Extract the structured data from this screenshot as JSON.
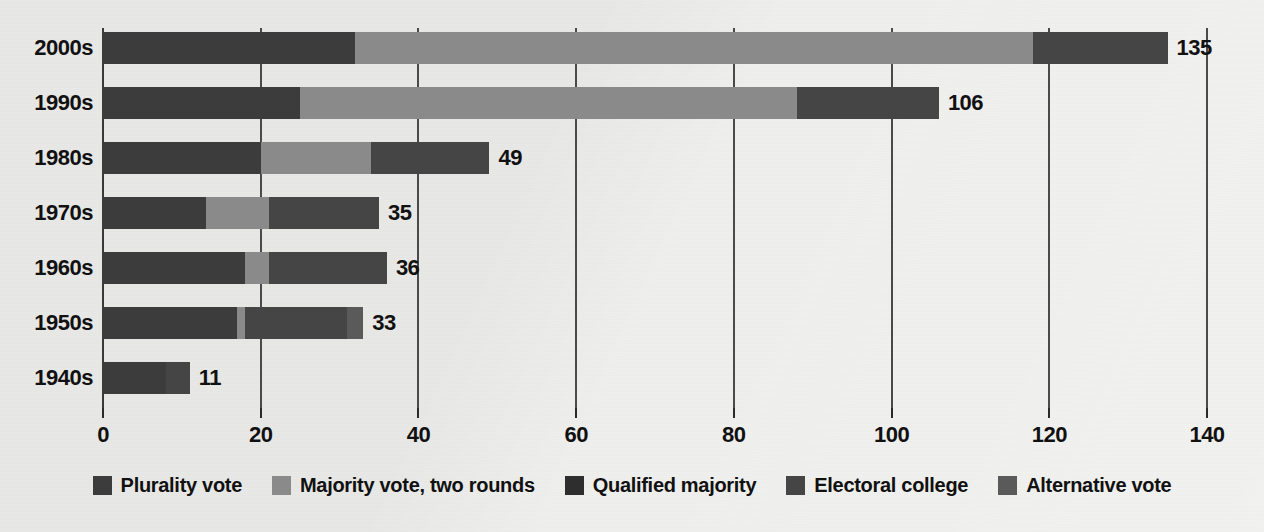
{
  "chart_data": {
    "type": "bar",
    "orientation": "horizontal",
    "stacked": true,
    "title": "",
    "subtitle": "",
    "xlabel": "",
    "ylabel": "",
    "xlim": [
      0,
      140
    ],
    "xticks": [
      0,
      20,
      40,
      60,
      80,
      100,
      120,
      140
    ],
    "xticklabels": [
      "0",
      "20",
      "40",
      "60",
      "80",
      "100",
      "120",
      "140"
    ],
    "grid": "vertical",
    "legend_position": "bottom",
    "categories": [
      "2000s",
      "1990s",
      "1980s",
      "1970s",
      "1960s",
      "1950s",
      "1940s"
    ],
    "series": [
      {
        "name": "Plurality vote",
        "color": "#3c3c3c",
        "values": [
          32,
          25,
          20,
          13,
          18,
          17,
          8
        ]
      },
      {
        "name": "Majority vote, two rounds",
        "color": "#8a8a8a",
        "values": [
          86,
          63,
          14,
          8,
          3,
          1,
          0
        ]
      },
      {
        "name": "Qualified majority",
        "color": "#2e2e2e",
        "values": [
          0,
          0,
          0,
          0,
          0,
          0,
          0
        ]
      },
      {
        "name": "Electoral college",
        "color": "#454545",
        "values": [
          17,
          18,
          15,
          14,
          15,
          13,
          3
        ]
      },
      {
        "name": "Alternative vote",
        "color": "#5a5a5a",
        "values": [
          0,
          0,
          0,
          0,
          0,
          2,
          0
        ]
      }
    ],
    "totals": [
      135,
      106,
      49,
      35,
      36,
      33,
      11
    ],
    "value_labels": [
      "135",
      "106",
      "49",
      "35",
      "36",
      "33",
      "11"
    ]
  },
  "legend": {
    "items": [
      {
        "label": "Plurality vote",
        "color": "#3c3c3c"
      },
      {
        "label": "Majority vote, two rounds",
        "color": "#8a8a8a"
      },
      {
        "label": "Qualified majority",
        "color": "#2e2e2e"
      },
      {
        "label": "Electoral college",
        "color": "#454545"
      },
      {
        "label": "Alternative vote",
        "color": "#5a5a5a"
      }
    ]
  },
  "colors": {
    "background": "#e8e8e6",
    "axis": "#4a4a4a",
    "text": "#111111"
  }
}
